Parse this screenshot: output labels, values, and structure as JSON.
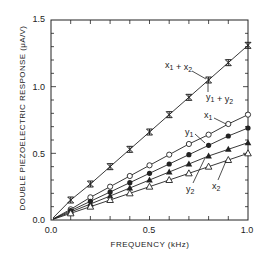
{
  "chart_data": {
    "type": "line",
    "title": "",
    "xlabel": "FREQUENCY (kHz)",
    "ylabel": "DOUBLE PIEZOELECTRIC RESPONSE (μA/V)",
    "xlim": [
      0.0,
      1.0
    ],
    "ylim": [
      0.0,
      1.5
    ],
    "xticks": [
      "0.0",
      "0.5",
      "1.0"
    ],
    "yticks": [
      "0.0",
      "0.5",
      "1.0",
      "1.5"
    ],
    "grid": false,
    "legend": "inline annotations",
    "x": [
      0.1,
      0.2,
      0.3,
      0.4,
      0.5,
      0.6,
      0.7,
      0.8,
      0.9,
      1.0
    ],
    "series": [
      {
        "name": "x1 + x2",
        "alt_name": "y1 + y2",
        "marker": "asterisk",
        "values": [
          0.15,
          0.27,
          0.4,
          0.53,
          0.66,
          0.79,
          0.92,
          1.05,
          1.18,
          1.31
        ]
      },
      {
        "name": "x1",
        "marker": "open-circle",
        "values": [
          0.08,
          0.17,
          0.25,
          0.33,
          0.41,
          0.49,
          0.57,
          0.64,
          0.72,
          0.79
        ]
      },
      {
        "name": "y1",
        "marker": "filled-circle",
        "values": [
          0.07,
          0.14,
          0.21,
          0.28,
          0.35,
          0.42,
          0.49,
          0.56,
          0.63,
          0.69
        ]
      },
      {
        "name": "y2",
        "marker": "filled-triangle",
        "values": [
          0.06,
          0.12,
          0.18,
          0.24,
          0.3,
          0.36,
          0.42,
          0.48,
          0.53,
          0.58
        ]
      },
      {
        "name": "x2",
        "marker": "open-triangle",
        "values": [
          0.05,
          0.1,
          0.15,
          0.2,
          0.25,
          0.3,
          0.35,
          0.4,
          0.45,
          0.5
        ]
      }
    ],
    "annotations": [
      {
        "text": "x1 + x2",
        "target": "x1 + x2"
      },
      {
        "text": "y1 + y2",
        "target": "x1 + x2"
      },
      {
        "text": "x1",
        "target": "x1"
      },
      {
        "text": "y1",
        "target": "y1"
      },
      {
        "text": "y2",
        "target": "y2"
      },
      {
        "text": "x2",
        "target": "x2"
      }
    ]
  },
  "labels": {
    "xlabel": "FREQUENCY (kHz)",
    "ylabel": "DOUBLE PIEZOELECTRIC RESPONSE (μA/V)",
    "x0": "0.0",
    "x05": "0.5",
    "x1": "1.0",
    "y0": "0.0",
    "y05": "0.5",
    "y1": "1.0",
    "y15": "1.5",
    "ann_sum_x": "x",
    "ann_sum_y": "y"
  }
}
